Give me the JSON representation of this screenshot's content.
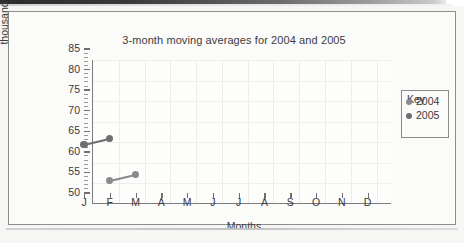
{
  "chart_data": {
    "type": "line",
    "title": "3-month moving averages for 2004 and 2005",
    "xlabel": "Months",
    "ylabel_line1": "Milk production in",
    "ylabel_line2": "thousands of litres",
    "categories": [
      "J",
      "F",
      "M",
      "A",
      "M",
      "J",
      "J",
      "A",
      "S",
      "O",
      "N",
      "D"
    ],
    "ylim": [
      50,
      85
    ],
    "ytick_labels": [
      "50",
      "55",
      "60",
      "65",
      "70",
      "75",
      "80",
      "85"
    ],
    "ytick_values": [
      50,
      55,
      60,
      65,
      70,
      75,
      80,
      85
    ],
    "ymajor_step": 5,
    "yminor_step": 1,
    "grid": true,
    "legend_position": "right",
    "series": [
      {
        "name": "2004",
        "color": "#8a8a8a",
        "points": [
          {
            "x": "F",
            "x_index": 1,
            "y": 53.0
          },
          {
            "x": "M",
            "x_index": 2,
            "y": 54.5
          }
        ]
      },
      {
        "name": "2005",
        "color": "#6e6e6e",
        "points": [
          {
            "x": "J",
            "x_index": 0,
            "y": 61.7
          },
          {
            "x": "F",
            "x_index": 1,
            "y": 63.2
          }
        ]
      }
    ]
  },
  "legend": {
    "title": "Key",
    "entries": [
      {
        "label": "2004",
        "color": "#8a8a8a"
      },
      {
        "label": "2005",
        "color": "#6e6e6e"
      }
    ]
  },
  "colors": {
    "axis": "#7c7c7c",
    "grid": "#ececea",
    "text": "#3a3a3a",
    "plot_background": "#fdfdfc",
    "page_background": "#f6f6f4",
    "frame_border": "#8d8d8d"
  }
}
